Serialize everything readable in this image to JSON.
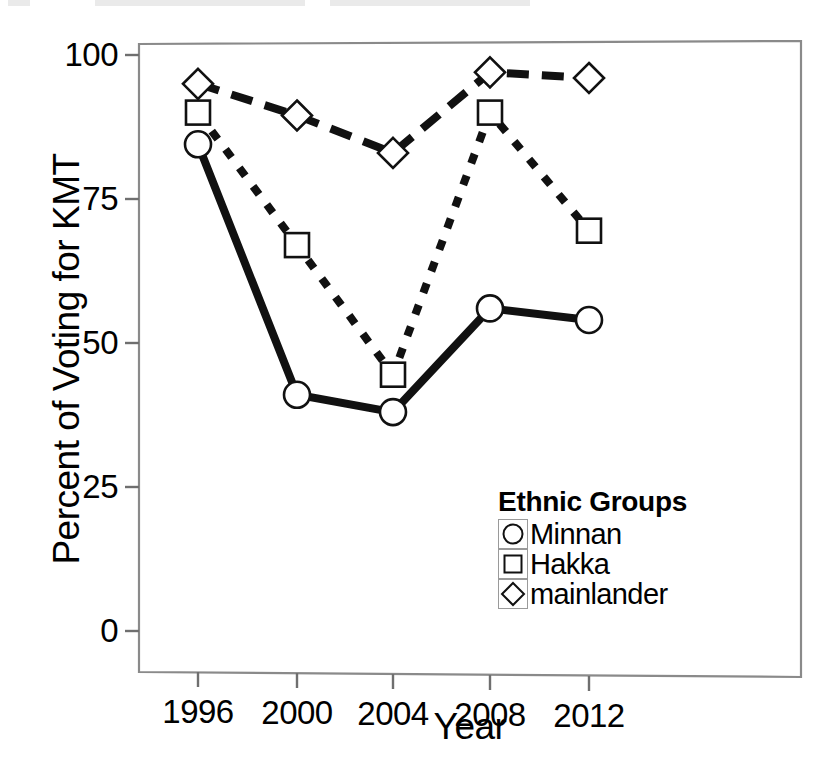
{
  "chart_data": {
    "type": "line",
    "title": "",
    "xlabel": "Year",
    "ylabel": "Percent of Voting for KMT",
    "categories": [
      "1996",
      "2000",
      "2004",
      "2008",
      "2012"
    ],
    "x": [
      1996,
      2000,
      2004,
      2008,
      2012
    ],
    "xlim": [
      1994,
      2014
    ],
    "ylim": [
      0,
      100
    ],
    "yticks": [
      "0",
      "25",
      "50",
      "75",
      "100"
    ],
    "ytick_values": [
      0,
      25,
      50,
      75,
      100
    ],
    "grid": false,
    "legend_position": "inside-lower-right",
    "legend_title": "Ethnic Groups",
    "series": [
      {
        "name": "Minnan",
        "marker": "circle",
        "line_style": "solid",
        "values": [
          84.5,
          41,
          38,
          56,
          54
        ]
      },
      {
        "name": "Hakka",
        "marker": "square",
        "line_style": "dotted",
        "values": [
          90,
          67,
          44.5,
          90,
          69.5
        ]
      },
      {
        "name": "mainlander",
        "marker": "diamond",
        "line_style": "dashed",
        "values": [
          95,
          89.5,
          83,
          97,
          96
        ]
      }
    ]
  },
  "legend": {
    "title": "Ethnic Groups",
    "entries": [
      {
        "label": "Minnan",
        "marker": "circle-marker"
      },
      {
        "label": "Hakka",
        "marker": "square-marker"
      },
      {
        "label": "mainlander",
        "marker": "diamond-marker"
      }
    ]
  },
  "axes": {
    "y_title": "Percent of Voting for KMT",
    "x_title": "Year",
    "y_tick_labels": [
      "100",
      "75",
      "50",
      "25",
      "0"
    ],
    "x_tick_labels": [
      "1996",
      "2000",
      "2004",
      "2008",
      "2012"
    ]
  },
  "colors": {
    "line": "#000000",
    "marker_fill": "#ffffff",
    "marker_stroke": "#000000",
    "frame": "#777777",
    "background": "#ffffff"
  }
}
